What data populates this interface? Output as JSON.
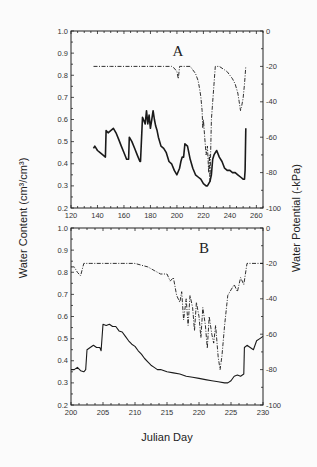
{
  "figure": {
    "ylabel_left": "Water Content (cm³/cm³)",
    "ylabel_right": "Water Potential (-kPa)",
    "xlabel": "Julian Day"
  },
  "chart_data": [
    {
      "type": "line",
      "panel": "A",
      "title": "A",
      "xlabel": "Julian Day",
      "ylabel": "Water Content (cm3/cm3)",
      "ylabel_right": "Water Potential (-kPa)",
      "xlim": [
        120,
        265
      ],
      "ylim": [
        0.2,
        1.0
      ],
      "ylim_right": [
        -100,
        0
      ],
      "xticks": [
        120,
        140,
        160,
        180,
        200,
        220,
        240,
        260
      ],
      "yticks": [
        0.2,
        0.3,
        0.4,
        0.5,
        0.6,
        0.7,
        0.8,
        0.9,
        1.0
      ],
      "yticks_right": [
        0,
        -20,
        -40,
        -60,
        -80,
        -100
      ],
      "grid": false,
      "series": [
        {
          "name": "Water Content",
          "axis": "left",
          "style": "solid",
          "x": [
            137,
            138,
            140,
            142,
            144,
            146,
            146.5,
            148,
            150,
            152,
            154,
            156,
            158,
            160,
            162,
            163.5,
            164,
            166,
            168,
            170,
            172,
            172.5,
            174,
            176,
            177,
            178,
            179,
            180,
            181,
            182,
            183,
            184,
            185,
            186,
            188,
            190,
            192,
            194,
            196,
            198,
            200,
            202,
            203,
            204,
            205,
            206,
            208,
            210,
            212,
            214,
            216,
            218,
            220,
            222,
            223,
            224,
            225,
            226,
            227,
            228,
            229,
            230,
            232,
            234,
            236,
            238,
            240,
            242,
            244,
            246,
            248,
            250,
            251,
            251.5,
            252
          ],
          "values": [
            0.47,
            0.48,
            0.46,
            0.45,
            0.44,
            0.43,
            0.55,
            0.54,
            0.55,
            0.56,
            0.54,
            0.51,
            0.48,
            0.45,
            0.42,
            0.42,
            0.52,
            0.5,
            0.47,
            0.44,
            0.41,
            0.41,
            0.61,
            0.58,
            0.64,
            0.58,
            0.62,
            0.56,
            0.6,
            0.64,
            0.6,
            0.57,
            0.55,
            0.52,
            0.48,
            0.47,
            0.45,
            0.41,
            0.4,
            0.37,
            0.35,
            0.38,
            0.41,
            0.43,
            0.43,
            0.49,
            0.48,
            0.42,
            0.38,
            0.35,
            0.34,
            0.33,
            0.31,
            0.3,
            0.3,
            0.31,
            0.32,
            0.35,
            0.42,
            0.44,
            0.45,
            0.46,
            0.43,
            0.41,
            0.38,
            0.37,
            0.37,
            0.36,
            0.36,
            0.35,
            0.34,
            0.33,
            0.33,
            0.37,
            0.56,
            0.58
          ]
        },
        {
          "name": "Water Potential",
          "axis": "right",
          "style": "dash-dot",
          "x": [
            137,
            150,
            160,
            170,
            180,
            190,
            196,
            198,
            200,
            201,
            202,
            203,
            205,
            210,
            212,
            214,
            216,
            217,
            218,
            219,
            219.5,
            220,
            221,
            222,
            223,
            224,
            224.5,
            225,
            226,
            227,
            228,
            229,
            230,
            232,
            234,
            236,
            238,
            240,
            242,
            244,
            246,
            247,
            248,
            249,
            250,
            251,
            252
          ],
          "values": [
            -20,
            -20,
            -20,
            -20,
            -20,
            -20,
            -20,
            -21,
            -23,
            -27,
            -20,
            -20,
            -20,
            -20,
            -22,
            -24,
            -28,
            -32,
            -37,
            -45,
            -55,
            -50,
            -60,
            -70,
            -65,
            -80,
            -70,
            -85,
            -50,
            -40,
            -30,
            -20,
            -20,
            -20,
            -21,
            -22,
            -23,
            -25,
            -27,
            -30,
            -35,
            -40,
            -45,
            -42,
            -38,
            -30,
            -20
          ]
        }
      ]
    },
    {
      "type": "line",
      "panel": "B",
      "title": "B",
      "xlabel": "Julian Day",
      "ylabel": "Water Content (cm3/cm3)",
      "ylabel_right": "Water Potential (-kPa)",
      "xlim": [
        200,
        230
      ],
      "ylim": [
        0.2,
        1.0
      ],
      "ylim_right": [
        -100,
        0
      ],
      "xticks": [
        200,
        205,
        210,
        215,
        220,
        225,
        230
      ],
      "yticks": [
        0.2,
        0.3,
        0.4,
        0.5,
        0.6,
        0.7,
        0.8,
        0.9,
        1.0
      ],
      "yticks_right": [
        0,
        -20,
        -40,
        -60,
        -80,
        -100
      ],
      "grid": false,
      "series": [
        {
          "name": "Water Content",
          "axis": "left",
          "style": "solid",
          "x": [
            200,
            200.5,
            201,
            201.5,
            202,
            202.3,
            202.5,
            203,
            203.5,
            204,
            204.5,
            204.7,
            205,
            205.5,
            206,
            206.5,
            207,
            207.5,
            208,
            208.5,
            209,
            209.5,
            210,
            210.5,
            211,
            211.5,
            212,
            212.5,
            213,
            213.5,
            214,
            215,
            216,
            217,
            218,
            219,
            220,
            221,
            222,
            223,
            224,
            224.5,
            225,
            225.5,
            226,
            226.5,
            227,
            227.1,
            227.5,
            228,
            228.5,
            229,
            229.5,
            230
          ],
          "values": [
            0.36,
            0.36,
            0.37,
            0.355,
            0.35,
            0.36,
            0.45,
            0.46,
            0.47,
            0.46,
            0.46,
            0.445,
            0.565,
            0.56,
            0.565,
            0.555,
            0.555,
            0.535,
            0.53,
            0.51,
            0.49,
            0.475,
            0.465,
            0.445,
            0.43,
            0.41,
            0.395,
            0.38,
            0.37,
            0.36,
            0.36,
            0.35,
            0.345,
            0.34,
            0.33,
            0.325,
            0.32,
            0.315,
            0.31,
            0.305,
            0.3,
            0.3,
            0.31,
            0.33,
            0.335,
            0.33,
            0.34,
            0.46,
            0.47,
            0.46,
            0.45,
            0.49,
            0.5,
            0.51
          ]
        },
        {
          "name": "Water Potential",
          "axis": "right",
          "style": "dash-dot",
          "x": [
            200,
            200.5,
            201,
            201.5,
            202,
            203,
            205,
            208,
            210,
            211,
            212,
            213,
            214,
            215,
            215.5,
            216,
            216.5,
            217,
            217.3,
            217.6,
            218,
            218.3,
            218.6,
            219,
            219.3,
            219.6,
            220,
            220.3,
            220.6,
            221,
            221.3,
            221.6,
            222,
            222.3,
            222.6,
            223,
            223.3,
            223.6,
            224,
            224.5,
            225,
            225.5,
            226,
            226.5,
            227,
            227.5,
            228,
            229,
            230
          ],
          "values": [
            -22,
            -22,
            -25,
            -27,
            -20,
            -20,
            -20,
            -20,
            -20,
            -21,
            -22,
            -24,
            -26,
            -26,
            -30,
            -28,
            -38,
            -42,
            -36,
            -52,
            -40,
            -55,
            -38,
            -45,
            -58,
            -42,
            -50,
            -62,
            -45,
            -55,
            -68,
            -50,
            -60,
            -65,
            -55,
            -73,
            -80,
            -72,
            -55,
            -38,
            -35,
            -32,
            -36,
            -28,
            -32,
            -20,
            -20,
            -20,
            -20
          ]
        }
      ]
    }
  ]
}
